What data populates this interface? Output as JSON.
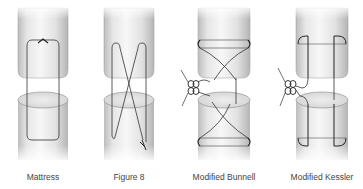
{
  "figure": {
    "panels": [
      {
        "id": "mattress",
        "label": "Mattress",
        "technique": "mattress-suture"
      },
      {
        "id": "figure8",
        "label": "Figure 8",
        "technique": "figure-8-suture"
      },
      {
        "id": "bunnell",
        "label": "Modified Bunnell",
        "technique": "modified-bunnell-suture"
      },
      {
        "id": "kessler",
        "label": "Modified Kessler",
        "technique": "modified-kessler-suture"
      }
    ]
  },
  "colors": {
    "background": "#ffffff",
    "tendon_light": "#f2f2f2",
    "tendon_shade": "#c9c9c9",
    "cut_surface": "#e3e3e3",
    "suture": "#333333",
    "label_text": "#444444"
  }
}
